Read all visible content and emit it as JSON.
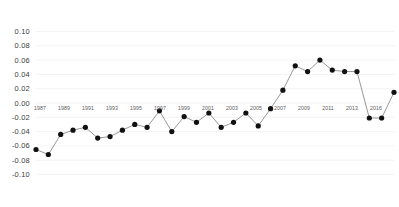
{
  "chart_data": {
    "type": "line",
    "title": "",
    "subtitle": "",
    "xlabel": "",
    "ylabel": "",
    "grid": true,
    "legend": false,
    "marker": "filled-circle",
    "line_color": "#8c8c8c",
    "marker_color": "#111111",
    "background": "#ffffff",
    "ylim": [
      -0.1,
      0.1
    ],
    "xlim": [
      1987,
      2016
    ],
    "ytick_labels": [
      "0.10",
      "0.08",
      "0.06",
      "0.04",
      "0.02",
      "0.00",
      "-0.02",
      "-0.04",
      "-0.06",
      "-0.08",
      "-0.10"
    ],
    "ytick_values": [
      0.1,
      0.08,
      0.06,
      0.04,
      0.02,
      0.0,
      -0.02,
      -0.04,
      -0.06,
      -0.08,
      -0.1
    ],
    "xtick_labels": [
      "1987",
      "1989",
      "1991",
      "1993",
      "1995",
      "1997",
      "1999",
      "2001",
      "2003",
      "2005",
      "2007",
      "2009",
      "2011",
      "2013",
      "2016"
    ],
    "xtick_values": [
      1987,
      1989,
      1991,
      1993,
      1995,
      1997,
      1999,
      2001,
      2003,
      2005,
      2007,
      2009,
      2011,
      2013,
      2016
    ],
    "x": [
      1987,
      1988,
      1989,
      1990,
      1991,
      1992,
      1993,
      1994,
      1995,
      1996,
      1997,
      1998,
      1999,
      2000,
      2001,
      2002,
      2003,
      2004,
      2005,
      2006,
      2007,
      2008,
      2009,
      2010,
      2011,
      2012,
      2013,
      2014,
      2015,
      2016
    ],
    "values": [
      -0.065,
      -0.072,
      -0.044,
      -0.038,
      -0.034,
      -0.049,
      -0.047,
      -0.038,
      -0.03,
      -0.034,
      -0.011,
      -0.04,
      -0.019,
      -0.027,
      -0.014,
      -0.034,
      -0.027,
      -0.014,
      -0.032,
      -0.008,
      0.018,
      0.052,
      0.044,
      0.06,
      0.046,
      0.044,
      0.044,
      -0.021,
      -0.021,
      0.015
    ],
    "series_name": ""
  }
}
